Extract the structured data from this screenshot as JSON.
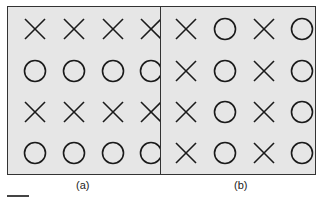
{
  "panels": [
    {
      "id": "a",
      "caption": "(a)",
      "rows": [
        [
          "X",
          "X",
          "X",
          "X"
        ],
        [
          "O",
          "O",
          "O",
          "O"
        ],
        [
          "X",
          "X",
          "X",
          "X"
        ],
        [
          "O",
          "O",
          "O",
          "O"
        ]
      ]
    },
    {
      "id": "b",
      "caption": "(b)",
      "rows": [
        [
          "X",
          "O",
          "X",
          "O"
        ],
        [
          "X",
          "O",
          "X",
          "O"
        ],
        [
          "X",
          "O",
          "X",
          "O"
        ],
        [
          "X",
          "O",
          "X",
          "O"
        ]
      ]
    }
  ],
  "colors": {
    "panel_bg": "#e6e6e6",
    "stroke": "#1a1a1a"
  }
}
